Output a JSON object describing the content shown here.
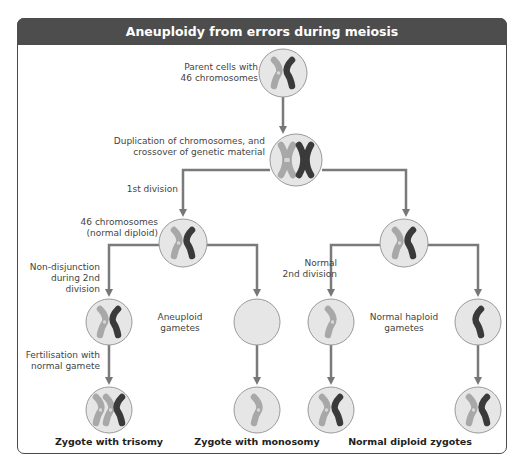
{
  "title": "Aneuploidy from errors during meiosis",
  "labels": {
    "parent_line1": "Parent cells with",
    "parent_line2": "46 chromosomes",
    "duplication_line1": "Duplication of chromosomes, and",
    "duplication_line2": "crossover of genetic material",
    "first_division": "1st division",
    "diploid_line1": "46 chromosomes",
    "diploid_line2": "(normal diploid)",
    "nondisjunction_line1": "Non-disjunction",
    "nondisjunction_line2": "during 2nd division",
    "aneuploid_line1": "Aneuploid",
    "aneuploid_line2": "gametes",
    "normal2nd_line1": "Normal",
    "normal2nd_line2": "2nd division",
    "haploid_line1": "Normal haploid",
    "haploid_line2": "gametes",
    "fertilisation_line1": "Fertilisation with",
    "fertilisation_line2": "normal gamete"
  },
  "outcomes": {
    "trisomy": "Zygote with trisomy",
    "monosomy": "Zygote with monosomy",
    "normal": "Normal diploid zygotes"
  },
  "colors": {
    "header_bg": "#4d4d4d",
    "cell_fill": "#e6e6e6",
    "cell_stroke": "#9a9a9a",
    "light_chromosome": "#a8a8a8",
    "dark_chromosome": "#3a3a3a",
    "arrow": "#777777"
  },
  "cells": [
    {
      "id": "parent",
      "chromosomes": [
        "light",
        "dark"
      ]
    },
    {
      "id": "duplicated",
      "chromosomes": [
        "light-x",
        "dark-x"
      ]
    },
    {
      "id": "diploid-left",
      "chromosomes": [
        "light",
        "dark"
      ]
    },
    {
      "id": "diploid-right",
      "chromosomes": [
        "light",
        "dark"
      ]
    },
    {
      "id": "gamete-disomic",
      "chromosomes": [
        "light",
        "dark"
      ]
    },
    {
      "id": "gamete-nullisomic",
      "chromosomes": []
    },
    {
      "id": "gamete-haploid-light",
      "chromosomes": [
        "light"
      ]
    },
    {
      "id": "gamete-haploid-dark",
      "chromosomes": [
        "dark"
      ]
    },
    {
      "id": "zygote-trisomy",
      "chromosomes": [
        "light",
        "light",
        "dark"
      ]
    },
    {
      "id": "zygote-monosomy",
      "chromosomes": [
        "light"
      ]
    },
    {
      "id": "zygote-normal-1",
      "chromosomes": [
        "light",
        "dark"
      ]
    },
    {
      "id": "zygote-normal-2",
      "chromosomes": [
        "light",
        "dark"
      ]
    }
  ]
}
